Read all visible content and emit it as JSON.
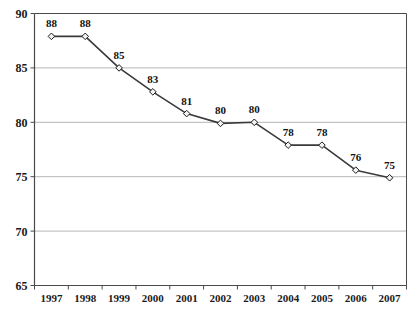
{
  "chart_data": {
    "type": "line",
    "title": "",
    "subtitle": "",
    "xlabel": "",
    "ylabel": "",
    "categories": [
      "1997",
      "1998",
      "1999",
      "2000",
      "2001",
      "2002",
      "2003",
      "2004",
      "2005",
      "2006",
      "2007"
    ],
    "values": [
      88,
      88,
      85,
      83,
      81,
      80,
      80,
      78,
      78,
      76,
      75
    ],
    "plotted_values": [
      87.9,
      87.9,
      85.0,
      82.8,
      80.8,
      79.9,
      80.0,
      77.9,
      77.9,
      75.6,
      74.9
    ],
    "point_labels": [
      "88",
      "88",
      "85",
      "83",
      "81",
      "80",
      "80",
      "78",
      "78",
      "76",
      "75"
    ],
    "ylim": [
      65,
      90
    ],
    "yticks": [
      65,
      70,
      75,
      80,
      85,
      90
    ],
    "ytick_labels": [
      "65",
      "70",
      "75",
      "80",
      "85",
      "90"
    ],
    "grid": true,
    "grid_axis": "y",
    "legend": false,
    "legend_position": "none",
    "series": [
      {
        "name": "",
        "values": [
          88,
          88,
          85,
          83,
          81,
          80,
          80,
          78,
          78,
          76,
          75
        ],
        "marker": "diamond",
        "line_color": "#3a3a3a",
        "marker_fill": "#f2f2f2",
        "marker_edge": "#1a1a1a",
        "show_labels": true
      }
    ],
    "colors": {
      "background": "#ffffff",
      "plot_background": "#ffffff",
      "grid_color": "#b5b5b5",
      "axis_color": "#4a4a4a",
      "line_color": "#3a3a3a",
      "marker_fill": "#f0f0f0",
      "marker_edge": "#1a1a1a",
      "label_color": "#111111"
    }
  },
  "axes": {
    "y_axis_name": "value-axis",
    "x_axis_name": "category-axis"
  }
}
